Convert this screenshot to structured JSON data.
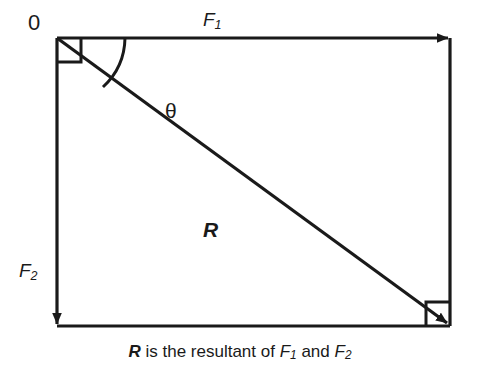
{
  "figure": {
    "type": "vector-parallelogram-diagram",
    "background_color": "#ffffff",
    "stroke_color": "#1a1a1a"
  },
  "labels": {
    "origin": "0",
    "force1": "F",
    "force1_subscript": "1",
    "force2": "F",
    "force2_subscript": "2",
    "angle": "θ",
    "resultant": "R"
  },
  "caption": {
    "resultant_symbol": "R",
    "text_mid": " is the resultant of ",
    "force1_symbol": "F",
    "force1_subscript": "1",
    "text_and": " and ",
    "force2_symbol": "F",
    "force2_subscript": "2"
  },
  "geometry": {
    "origin": [
      57,
      38
    ],
    "top_right": [
      450,
      38
    ],
    "bottom_left": [
      57,
      326
    ],
    "bottom_right": [
      450,
      326
    ],
    "f1_arrow_direction": "right",
    "f2_arrow_direction": "down",
    "resultant_arrow_direction": "down-right",
    "right_angle_markers": [
      "origin",
      "bottom-right"
    ],
    "angle_arc_at": "origin"
  }
}
